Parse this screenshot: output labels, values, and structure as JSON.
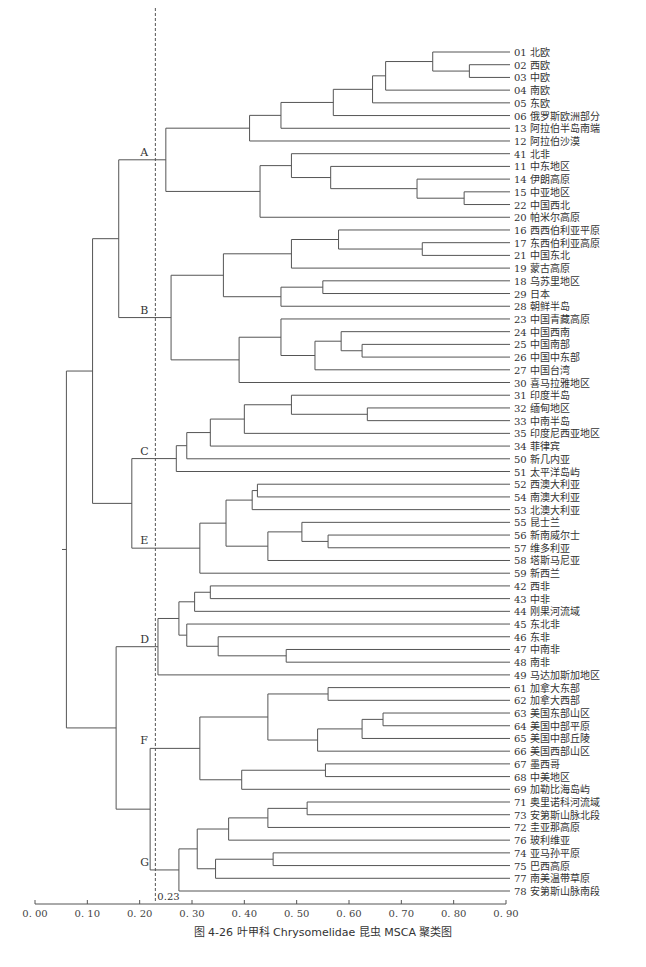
{
  "caption": "图 4-26  叶甲科 Chrysomelidae 昆虫 MSCA 聚类图",
  "chart_data": {
    "type": "dendrogram",
    "title": "图 4-26  叶甲科 Chrysomelidae 昆虫 MSCA 聚类图",
    "xlabel": "",
    "ylabel": "",
    "xlim": [
      0.0,
      0.9
    ],
    "x_ticks": [
      "0.00",
      "0.10",
      "0.20",
      "0.30",
      "0.40",
      "0.50",
      "0.60",
      "0.70",
      "0.80",
      "0.90"
    ],
    "threshold": {
      "value": 0.23,
      "label": "0.23",
      "style": "dashed"
    },
    "clusters": [
      {
        "label": "A",
        "leaves": [
          "01",
          "02",
          "03",
          "04",
          "05",
          "06",
          "13",
          "12",
          "41",
          "11",
          "14",
          "15",
          "22",
          "20"
        ]
      },
      {
        "label": "B",
        "leaves": [
          "16",
          "17",
          "21",
          "19",
          "18",
          "29",
          "28",
          "23",
          "24",
          "25",
          "26",
          "27",
          "30"
        ]
      },
      {
        "label": "C",
        "leaves": [
          "31",
          "32",
          "33",
          "35",
          "34",
          "50",
          "51"
        ]
      },
      {
        "label": "E",
        "leaves": [
          "52",
          "54",
          "53",
          "55",
          "56",
          "57",
          "58",
          "59"
        ]
      },
      {
        "label": "D",
        "leaves": [
          "42",
          "43",
          "44",
          "45",
          "46",
          "47",
          "48",
          "49"
        ]
      },
      {
        "label": "F",
        "leaves": [
          "61",
          "62",
          "63",
          "64",
          "65",
          "66",
          "67",
          "68",
          "69"
        ]
      },
      {
        "label": "G",
        "leaves": [
          "71",
          "73",
          "72",
          "76",
          "74",
          "75",
          "77",
          "78"
        ]
      }
    ],
    "leaves": [
      {
        "id": "01",
        "name": "北欧"
      },
      {
        "id": "02",
        "name": "西欧"
      },
      {
        "id": "03",
        "name": "中欧"
      },
      {
        "id": "04",
        "name": "南欧"
      },
      {
        "id": "05",
        "name": "东欧"
      },
      {
        "id": "06",
        "name": "俄罗斯欧洲部分"
      },
      {
        "id": "13",
        "name": "阿拉伯半岛南端"
      },
      {
        "id": "12",
        "name": "阿拉伯沙漠"
      },
      {
        "id": "41",
        "name": "北非"
      },
      {
        "id": "11",
        "name": "中东地区"
      },
      {
        "id": "14",
        "name": "伊朗高原"
      },
      {
        "id": "15",
        "name": "中亚地区"
      },
      {
        "id": "22",
        "name": "中国西北"
      },
      {
        "id": "20",
        "name": "帕米尔高原"
      },
      {
        "id": "16",
        "name": "西西伯利亚平原"
      },
      {
        "id": "17",
        "name": "东西伯利亚高原"
      },
      {
        "id": "21",
        "name": "中国东北"
      },
      {
        "id": "19",
        "name": "蒙古高原"
      },
      {
        "id": "18",
        "name": "乌苏里地区"
      },
      {
        "id": "29",
        "name": "日本"
      },
      {
        "id": "28",
        "name": "朝鲜半岛"
      },
      {
        "id": "23",
        "name": "中国青藏高原"
      },
      {
        "id": "24",
        "name": "中国西南"
      },
      {
        "id": "25",
        "name": "中国南部"
      },
      {
        "id": "26",
        "name": "中国中东部"
      },
      {
        "id": "27",
        "name": "中国台湾"
      },
      {
        "id": "30",
        "name": "喜马拉雅地区"
      },
      {
        "id": "31",
        "name": "印度半岛"
      },
      {
        "id": "32",
        "name": "缅甸地区"
      },
      {
        "id": "33",
        "name": "中南半岛"
      },
      {
        "id": "35",
        "name": "印度尼西亚地区"
      },
      {
        "id": "34",
        "name": "菲律宾"
      },
      {
        "id": "50",
        "name": "新几内亚"
      },
      {
        "id": "51",
        "name": "太平洋岛屿"
      },
      {
        "id": "52",
        "name": "西澳大利亚"
      },
      {
        "id": "54",
        "name": "南澳大利亚"
      },
      {
        "id": "53",
        "name": "北澳大利亚"
      },
      {
        "id": "55",
        "name": "昆士兰"
      },
      {
        "id": "56",
        "name": "新南威尔士"
      },
      {
        "id": "57",
        "name": "维多利亚"
      },
      {
        "id": "58",
        "name": "塔斯马尼亚"
      },
      {
        "id": "59",
        "name": "新西兰"
      },
      {
        "id": "42",
        "name": "西非"
      },
      {
        "id": "43",
        "name": "中非"
      },
      {
        "id": "44",
        "name": "刚果河流域"
      },
      {
        "id": "45",
        "name": "东北非"
      },
      {
        "id": "46",
        "name": "东非"
      },
      {
        "id": "47",
        "name": "中南非"
      },
      {
        "id": "48",
        "name": "南非"
      },
      {
        "id": "49",
        "name": "马达加斯加地区"
      },
      {
        "id": "61",
        "name": "加拿大东部"
      },
      {
        "id": "62",
        "name": "加拿大西部"
      },
      {
        "id": "63",
        "name": "美国东部山区"
      },
      {
        "id": "64",
        "name": "美国中部平原"
      },
      {
        "id": "65",
        "name": "美国中部丘陵"
      },
      {
        "id": "66",
        "name": "美国西部山区"
      },
      {
        "id": "67",
        "name": "墨西哥"
      },
      {
        "id": "68",
        "name": "中美地区"
      },
      {
        "id": "69",
        "name": "加勒比海岛屿"
      },
      {
        "id": "71",
        "name": "奥里诺科河流域"
      },
      {
        "id": "73",
        "name": "安第斯山脉北段"
      },
      {
        "id": "72",
        "name": "圭亚那高原"
      },
      {
        "id": "76",
        "name": "玻利维亚"
      },
      {
        "id": "74",
        "name": "亚马孙平原"
      },
      {
        "id": "75",
        "name": "巴西高原"
      },
      {
        "id": "77",
        "name": "南美温带草原"
      },
      {
        "id": "78",
        "name": "安第斯山脉南段"
      }
    ],
    "tree": {
      "h": 0.06,
      "c": [
        {
          "h": 0.11,
          "c": [
            {
              "h": 0.16,
              "c": [
                {
                  "h": 0.25,
                  "label": "A",
                  "c": [
                    {
                      "h": 0.41,
                      "c": [
                        {
                          "h": 0.47,
                          "c": [
                            {
                              "h": 0.57,
                              "c": [
                                {
                                  "h": 0.645,
                                  "c": [
                                    {
                                      "h": 0.67,
                                      "c": [
                                        {
                                          "h": 0.76,
                                          "c": [
                                            "01",
                                            {
                                              "h": 0.83,
                                              "c": [
                                                "02",
                                                "03"
                                              ]
                                            }
                                          ]
                                        },
                                        "04"
                                      ]
                                    },
                                    "05"
                                  ]
                                },
                                "06"
                              ]
                            },
                            "13"
                          ]
                        },
                        "12"
                      ]
                    },
                    {
                      "h": 0.43,
                      "c": [
                        {
                          "h": 0.49,
                          "c": [
                            "41",
                            {
                              "h": 0.565,
                              "c": [
                                "11",
                                {
                                  "h": 0.73,
                                  "c": [
                                    "14",
                                    {
                                      "h": 0.82,
                                      "c": [
                                        "15",
                                        "22"
                                      ]
                                    }
                                  ]
                                }
                              ]
                            }
                          ]
                        },
                        "20"
                      ]
                    }
                  ]
                },
                {
                  "h": 0.26,
                  "label": "B",
                  "c": [
                    {
                      "h": 0.36,
                      "c": [
                        {
                          "h": 0.49,
                          "c": [
                            {
                              "h": 0.58,
                              "c": [
                                "16",
                                {
                                  "h": 0.74,
                                  "c": [
                                    "17",
                                    "21"
                                  ]
                                }
                              ]
                            },
                            "19"
                          ]
                        },
                        {
                          "h": 0.47,
                          "c": [
                            {
                              "h": 0.55,
                              "c": [
                                "18",
                                "29"
                              ]
                            },
                            "28"
                          ]
                        }
                      ]
                    },
                    {
                      "h": 0.39,
                      "c": [
                        {
                          "h": 0.47,
                          "c": [
                            "23",
                            {
                              "h": 0.535,
                              "c": [
                                {
                                  "h": 0.585,
                                  "c": [
                                    "24",
                                    {
                                      "h": 0.625,
                                      "c": [
                                        "25",
                                        "26"
                                      ]
                                    }
                                  ]
                                },
                                "27"
                              ]
                            }
                          ]
                        },
                        "30"
                      ]
                    }
                  ]
                }
              ]
            },
            {
              "h": 0.185,
              "c": [
                {
                  "h": 0.27,
                  "label": "C",
                  "c": [
                    {
                      "h": 0.29,
                      "c": [
                        {
                          "h": 0.335,
                          "c": [
                            {
                              "h": 0.4,
                              "c": [
                                {
                                  "h": 0.49,
                                  "c": [
                                    "31",
                                    {
                                      "h": 0.635,
                                      "c": [
                                        "32",
                                        "33"
                                      ]
                                    }
                                  ]
                                },
                                "35"
                              ]
                            },
                            "34"
                          ]
                        },
                        "50"
                      ]
                    },
                    "51"
                  ]
                },
                {
                  "h": 0.315,
                  "label": "E",
                  "c": [
                    {
                      "h": 0.365,
                      "c": [
                        {
                          "h": 0.415,
                          "c": [
                            {
                              "h": 0.425,
                              "c": [
                                "52",
                                "54"
                              ]
                            },
                            "53"
                          ]
                        },
                        {
                          "h": 0.445,
                          "c": [
                            {
                              "h": 0.51,
                              "c": [
                                "55",
                                {
                                  "h": 0.56,
                                  "c": [
                                    "56",
                                    "57"
                                  ]
                                }
                              ]
                            },
                            "58"
                          ]
                        }
                      ]
                    },
                    "59"
                  ]
                }
              ]
            }
          ]
        },
        {
          "h": 0.155,
          "c": [
            {
              "h": 0.235,
              "label": "D",
              "c": [
                {
                  "h": 0.275,
                  "c": [
                    {
                      "h": 0.305,
                      "c": [
                        {
                          "h": 0.335,
                          "c": [
                            "42",
                            "43"
                          ]
                        },
                        "44"
                      ]
                    },
                    {
                      "h": 0.29,
                      "c": [
                        "45",
                        {
                          "h": 0.35,
                          "c": [
                            "46",
                            {
                              "h": 0.48,
                              "c": [
                                "47",
                                "48"
                              ]
                            }
                          ]
                        }
                      ]
                    }
                  ]
                },
                "49"
              ]
            },
            {
              "h": 0.22,
              "c": [
                {
                  "h": 0.315,
                  "label": "F",
                  "c": [
                    {
                      "h": 0.445,
                      "c": [
                        {
                          "h": 0.56,
                          "c": [
                            "61",
                            "62"
                          ]
                        },
                        {
                          "h": 0.54,
                          "c": [
                            {
                              "h": 0.625,
                              "c": [
                                {
                                  "h": 0.665,
                                  "c": [
                                    "63",
                                    "64"
                                  ]
                                },
                                "65"
                              ]
                            },
                            "66"
                          ]
                        }
                      ]
                    },
                    {
                      "h": 0.395,
                      "c": [
                        {
                          "h": 0.555,
                          "c": [
                            "67",
                            "68"
                          ]
                        },
                        "69"
                      ]
                    }
                  ]
                },
                {
                  "h": 0.275,
                  "label": "G",
                  "c": [
                    {
                      "h": 0.31,
                      "c": [
                        {
                          "h": 0.37,
                          "c": [
                            {
                              "h": 0.445,
                              "c": [
                                {
                                  "h": 0.52,
                                  "c": [
                                    "71",
                                    "73"
                                  ]
                                },
                                "72"
                              ]
                            },
                            "76"
                          ]
                        },
                        {
                          "h": 0.345,
                          "c": [
                            {
                              "h": 0.455,
                              "c": [
                                "74",
                                "75"
                              ]
                            },
                            "77"
                          ]
                        }
                      ]
                    },
                    "78"
                  ]
                }
              ]
            }
          ]
        }
      ]
    }
  }
}
